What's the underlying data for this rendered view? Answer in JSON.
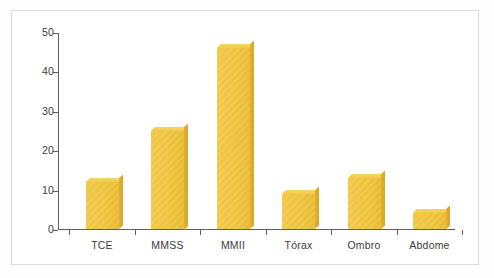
{
  "chart_data": {
    "type": "bar",
    "title": "",
    "subtitle": "",
    "xlabel": "",
    "ylabel": "",
    "categories": [
      "TCE",
      "MMSS",
      "MMII",
      "Tórax",
      "Ombro",
      "Abdome"
    ],
    "values": [
      12,
      25,
      46,
      9,
      13,
      4
    ],
    "ylim": [
      0,
      50
    ],
    "y_ticks": [
      0,
      10,
      20,
      30,
      40,
      50
    ],
    "y_tick_labels": [
      "0",
      "10",
      "20",
      "30",
      "40",
      "50"
    ],
    "grid": false,
    "legend": false,
    "legend_position": "none",
    "bar_color": "#EEC33C",
    "bar_top_color": "#F5D15C",
    "bar_side_color": "#DCA92B",
    "axis_color": "#5F5F5F",
    "frame_color": "#DEDCDA",
    "background_color": "#FFFFFF",
    "style": "3d-shaded-bars"
  }
}
